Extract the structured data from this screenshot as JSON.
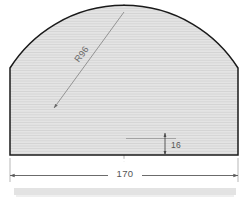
{
  "drawing": {
    "title": "Concave arc profile cross-section",
    "background_color": "#ffffff",
    "outline_color": "#1a1a1a",
    "fill_color": "#e2e2e2",
    "hatch_color": "#c9c9c9",
    "dimension_color": "#5a5a5a",
    "centerline_color": "#9a9a9a"
  },
  "dimensions": {
    "radius": {
      "label": "R96",
      "value": 96,
      "prefix": "R",
      "leader_from": [
        124,
        12
      ],
      "leader_to": [
        52,
        110
      ],
      "text_rotation": -53
    },
    "depth": {
      "label": "16",
      "value": 16,
      "axis": "vertical",
      "from_y": 138,
      "to_y": 155,
      "x": 165
    },
    "width": {
      "label": "170",
      "value": 170,
      "axis": "horizontal",
      "from_x": 10,
      "to_x": 238,
      "y": 175
    }
  },
  "geometry": {
    "left_x": 10,
    "right_x": 238,
    "top_y": 68,
    "baseline_y": 155,
    "arc_low_y": 138,
    "center_x": 124,
    "arc_center_y": 12
  },
  "centerline": {
    "name": "vertical-centerline",
    "x": 124,
    "top_y": 8,
    "bottom_y": 162
  },
  "center_mark": {
    "name": "arc-center-crosshair",
    "x": 124,
    "y": 12,
    "size": 9
  },
  "footer_strip": {
    "visible": true,
    "color": "#dcdcdc"
  }
}
